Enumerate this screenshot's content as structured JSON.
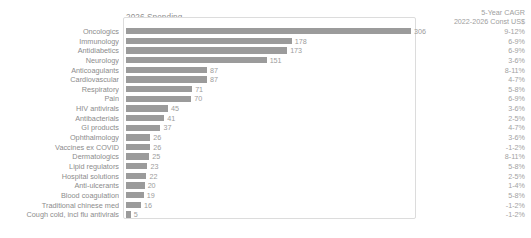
{
  "header": {
    "spending_title": "2026 Spending",
    "cagr_title_line1": "5-Year CAGR",
    "cagr_title_line2": "2022-2026 Const US$"
  },
  "colors": {
    "bar": "#9b9b9b",
    "text": "#8c8c8c",
    "frame": "#dcdcdc",
    "background": "#ffffff"
  },
  "chart_data": {
    "type": "bar",
    "orientation": "horizontal",
    "title": "2026 Spending",
    "xlabel": "",
    "ylabel": "",
    "xlim": [
      0,
      306
    ],
    "grid": false,
    "legend": false,
    "categories": [
      "Oncologics",
      "Immunology",
      "Antidiabetics",
      "Neurology",
      "Anticoagulants",
      "Cardiovascular",
      "Respiratory",
      "Pain",
      "HIV antivirals",
      "Antibacterials",
      "GI products",
      "Ophthalmology",
      "Vaccines ex COVID",
      "Dermatologics",
      "Lipid regulators",
      "Hospital solutions",
      "Anti-ulcerants",
      "Blood coagulation",
      "Traditional chinese med",
      "Cough cold, incl flu antivirals"
    ],
    "values": [
      306,
      178,
      173,
      151,
      87,
      87,
      71,
      70,
      45,
      41,
      37,
      26,
      26,
      25,
      23,
      22,
      20,
      19,
      16,
      5
    ],
    "series": [
      {
        "name": "2026 Spending",
        "values": [
          306,
          178,
          173,
          151,
          87,
          87,
          71,
          70,
          45,
          41,
          37,
          26,
          26,
          25,
          23,
          22,
          20,
          19,
          16,
          5
        ]
      }
    ],
    "annotations": {
      "column_name": "5-Year CAGR 2022-2026 Const US$",
      "cagr": [
        "9-12%",
        "6-9%",
        "6-9%",
        "3-6%",
        "8-11%",
        "4-7%",
        "5-8%",
        "6-9%",
        "3-6%",
        "2-5%",
        "4-7%",
        "3-6%",
        "-1-2%",
        "8-11%",
        "5-8%",
        "2-5%",
        "1-4%",
        "5-8%",
        "-1-2%",
        "-1-2%"
      ]
    }
  }
}
